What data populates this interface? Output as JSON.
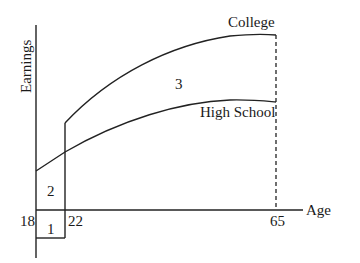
{
  "diagram": {
    "type": "education-earnings-diagram",
    "axes": {
      "y_label": "Earnings",
      "x_label": "Age"
    },
    "ticks": {
      "age_18": "18",
      "age_22": "22",
      "age_65": "65"
    },
    "curves": {
      "college": "College",
      "high_school": "High School"
    },
    "regions": {
      "r1": "1",
      "r2": "2",
      "r3": "3"
    },
    "colors": {
      "ink": "#222222",
      "background": "#ffffff"
    }
  }
}
